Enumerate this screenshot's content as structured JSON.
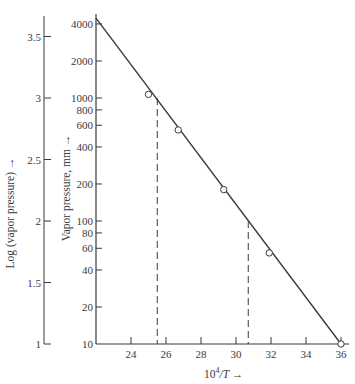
{
  "chart_data": {
    "type": "line",
    "title": "",
    "xlabel": "10^4/T →",
    "xlabel_parts": {
      "base": "10",
      "sup": "4",
      "rest": "/T →"
    },
    "ylabel_left": "Log (vapor pressure) →",
    "ylabel_right": "Vapor pressure, mm →",
    "xlim": [
      22,
      36
    ],
    "x_ticks": [
      24,
      26,
      28,
      30,
      32,
      34,
      36
    ],
    "ylim_pressure_mm": [
      10,
      4500
    ],
    "y_scale": "log",
    "y_ticks_pressure": [
      4000,
      2000,
      1000,
      800,
      600,
      400,
      200,
      100,
      80,
      60,
      40,
      20,
      10
    ],
    "y_ticks_log": [
      3.5,
      3,
      2.5,
      2,
      1.5,
      1
    ],
    "grid": false,
    "legend": null,
    "series": [
      {
        "name": "measured points",
        "marker": "open-circle",
        "x": [
          25.0,
          26.7,
          29.3,
          31.9,
          36.0
        ],
        "y_pressure_mm": [
          1070,
          550,
          180,
          55,
          10
        ],
        "y_log": [
          3.03,
          2.74,
          2.26,
          1.74,
          1.0
        ]
      },
      {
        "name": "fitted line",
        "style": "solid",
        "x": [
          22.0,
          36.0
        ],
        "y_pressure_mm": [
          4460,
          10
        ],
        "y_log": [
          3.65,
          1.0
        ]
      }
    ],
    "annotations": [
      {
        "type": "dashed-vertical",
        "x": 25.5,
        "from_pressure_mm": 1000,
        "to_pressure_mm": 10
      },
      {
        "type": "dashed-vertical",
        "x": 30.7,
        "from_pressure_mm": 100,
        "to_pressure_mm": 10
      }
    ]
  },
  "colors": {
    "ink": "#3a3a3a",
    "background": "#ffffff"
  }
}
